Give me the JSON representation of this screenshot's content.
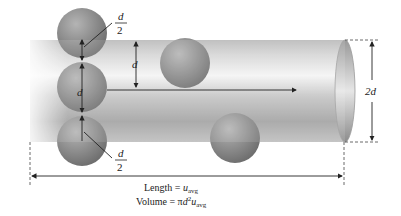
{
  "diagram": {
    "labels": {
      "half_d_top": {
        "num": "d",
        "den": "2"
      },
      "half_d_bottom": {
        "num": "d",
        "den": "2"
      },
      "d_spacing": "d",
      "d_sphere": "d",
      "diameter": "2d"
    },
    "caption": {
      "length_prefix": "Length = ",
      "length_var": "u",
      "length_sub": "avg",
      "volume_prefix": "Volume = ",
      "volume_pi": "π",
      "volume_d": "d",
      "volume_exp": "2",
      "volume_var": "u",
      "volume_sub": "avg"
    },
    "colors": {
      "sphere": "#8a8a8a",
      "tube_light": "#f2f2f2",
      "tube_dark": "#9a9a9a",
      "line": "#222222"
    }
  }
}
